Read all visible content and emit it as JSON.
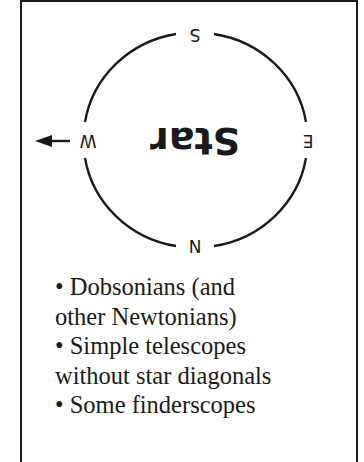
{
  "diagram": {
    "center_label": "Star",
    "center_label_rotation": "180deg",
    "compass": {
      "top": "S",
      "bottom": "N",
      "left": "W",
      "right": "E",
      "left_arrow": "arrow pointing left (west)"
    },
    "colors": {
      "stroke": "#1a1a1a",
      "background": "#ffffff"
    }
  },
  "list": {
    "lines": [
      "• Dobsonians (and",
      "other Newtonians)",
      "• Simple telescopes",
      "without star diagonals",
      "• Some finderscopes"
    ]
  }
}
